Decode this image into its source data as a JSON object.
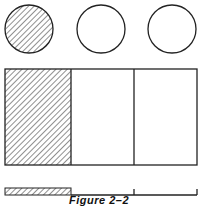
{
  "figure": {
    "caption": "Figure 2–2",
    "models": [
      {
        "type": "circles",
        "count": 3,
        "shaded": 1
      },
      {
        "type": "rectangle",
        "parts": 3,
        "shaded": 1
      },
      {
        "type": "number-line",
        "parts": 3,
        "shaded": 1
      }
    ],
    "colors": {
      "stroke": "#222222",
      "fill": "#ffffff"
    }
  }
}
